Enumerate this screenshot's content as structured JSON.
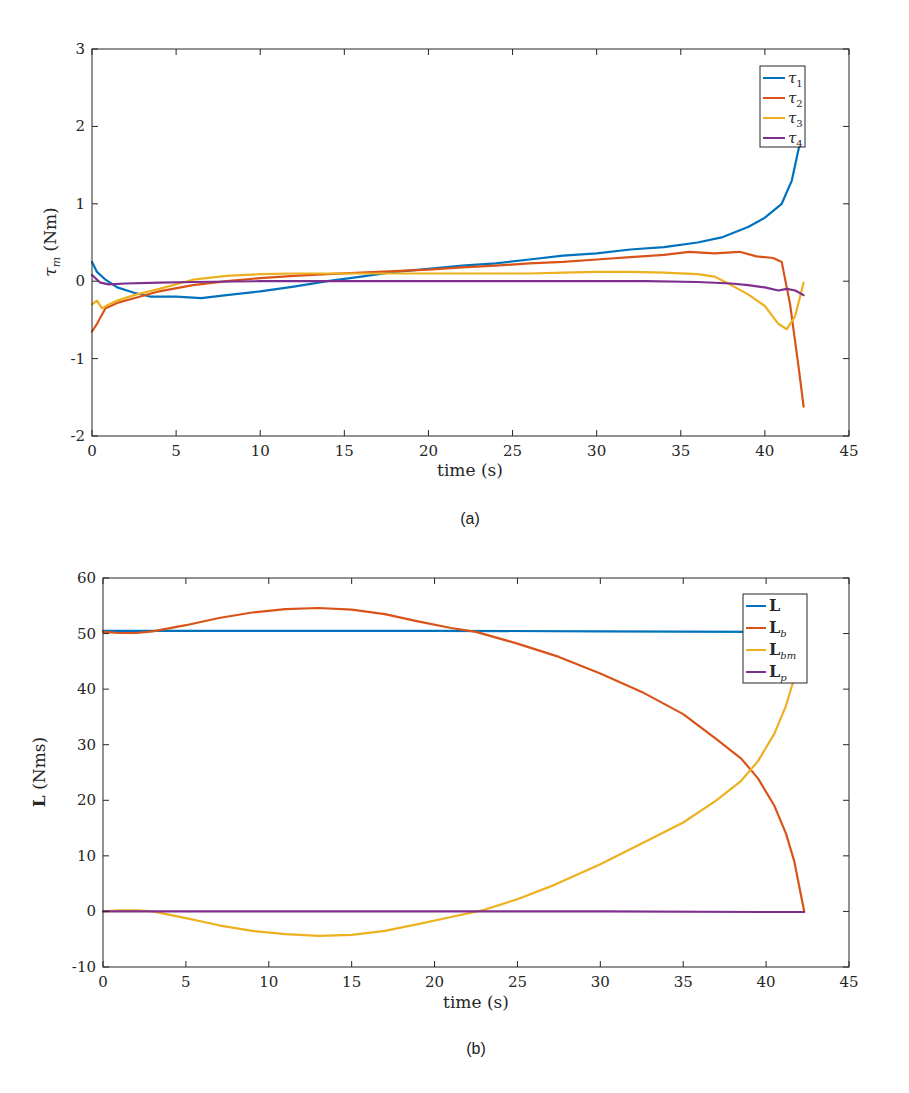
{
  "chart_data": [
    {
      "id": "a",
      "type": "line",
      "caption": "(a)",
      "title": "",
      "xlabel": "time (s)",
      "ylabel": "τm (Nm)",
      "xlim": [
        0,
        45
      ],
      "ylim": [
        -2,
        3
      ],
      "xticks": [
        0,
        5,
        10,
        15,
        20,
        25,
        30,
        35,
        40,
        45
      ],
      "yticks": [
        -2,
        -1,
        0,
        1,
        2,
        3
      ],
      "grid": false,
      "legend_position": "upper right",
      "series": [
        {
          "name": "τ1",
          "color": "#0072BD",
          "x": [
            0,
            0.3,
            0.8,
            1.5,
            2.5,
            3.5,
            5,
            6.5,
            8,
            10,
            12,
            14,
            16,
            18,
            20,
            22,
            24,
            26,
            28,
            30,
            32,
            34,
            36,
            37.5,
            39,
            40,
            41,
            41.6,
            42,
            42.3
          ],
          "y": [
            0.25,
            0.12,
            0.02,
            -0.08,
            -0.15,
            -0.2,
            -0.2,
            -0.22,
            -0.18,
            -0.13,
            -0.07,
            0.0,
            0.06,
            0.12,
            0.16,
            0.2,
            0.23,
            0.28,
            0.33,
            0.36,
            0.41,
            0.44,
            0.5,
            0.57,
            0.7,
            0.82,
            1.0,
            1.3,
            1.7,
            2.02
          ]
        },
        {
          "name": "τ2",
          "color": "#D95319",
          "x": [
            0,
            0.3,
            0.8,
            1.5,
            2.5,
            4,
            6,
            8,
            10,
            12,
            14,
            16,
            18,
            20,
            22,
            24,
            26,
            28,
            30,
            32,
            34,
            35.5,
            37,
            38.5,
            39.5,
            40.5,
            41,
            41.5,
            42,
            42.3
          ],
          "y": [
            -0.65,
            -0.55,
            -0.35,
            -0.28,
            -0.22,
            -0.13,
            -0.05,
            0.0,
            0.04,
            0.07,
            0.09,
            0.11,
            0.13,
            0.15,
            0.18,
            0.2,
            0.23,
            0.25,
            0.28,
            0.31,
            0.34,
            0.38,
            0.36,
            0.38,
            0.32,
            0.3,
            0.25,
            -0.3,
            -1.1,
            -1.62
          ]
        },
        {
          "name": "τ3",
          "color": "#EDB120",
          "x": [
            0,
            0.3,
            0.6,
            1.0,
            1.5,
            2.5,
            4,
            6,
            8,
            10,
            12,
            14,
            16,
            18,
            20,
            22,
            24,
            26,
            28,
            30,
            32,
            34,
            36,
            37,
            38,
            39,
            40,
            40.8,
            41.3,
            41.8,
            42.3
          ],
          "y": [
            -0.3,
            -0.25,
            -0.35,
            -0.3,
            -0.25,
            -0.18,
            -0.1,
            0.02,
            0.07,
            0.09,
            0.1,
            0.1,
            0.1,
            0.1,
            0.1,
            0.1,
            0.1,
            0.1,
            0.11,
            0.12,
            0.12,
            0.11,
            0.09,
            0.06,
            -0.05,
            -0.17,
            -0.32,
            -0.55,
            -0.62,
            -0.45,
            -0.02
          ]
        },
        {
          "name": "τ4",
          "color": "#7E2F8E",
          "x": [
            0,
            0.5,
            1.0,
            2,
            4,
            6,
            10,
            15,
            20,
            25,
            30,
            33,
            36,
            38,
            39,
            40,
            40.8,
            41.3,
            41.8,
            42.3
          ],
          "y": [
            0.08,
            -0.02,
            -0.04,
            -0.03,
            -0.02,
            -0.01,
            0.0,
            0.0,
            0.0,
            0.0,
            0.0,
            0.0,
            -0.01,
            -0.03,
            -0.05,
            -0.08,
            -0.12,
            -0.1,
            -0.12,
            -0.18
          ]
        }
      ]
    },
    {
      "id": "b",
      "type": "line",
      "caption": "(b)",
      "title": "",
      "xlabel": "time (s)",
      "ylabel": "L (Nms)",
      "xlim": [
        0,
        45
      ],
      "ylim": [
        -10,
        60
      ],
      "xticks": [
        0,
        5,
        10,
        15,
        20,
        25,
        30,
        35,
        40,
        45
      ],
      "yticks": [
        -10,
        0,
        10,
        20,
        30,
        40,
        50,
        60
      ],
      "grid": false,
      "legend_position": "upper right",
      "series": [
        {
          "name": "L",
          "color": "#0072BD",
          "x": [
            0,
            10,
            20,
            30,
            40,
            42.3
          ],
          "y": [
            50.5,
            50.5,
            50.5,
            50.4,
            50.3,
            50.3
          ]
        },
        {
          "name": "Lb",
          "color": "#D95319",
          "x": [
            0,
            1,
            2,
            3,
            5,
            7,
            9,
            11,
            13,
            15,
            17,
            19,
            21,
            22.5,
            25,
            27.5,
            30,
            32.5,
            35,
            37,
            38.5,
            39.5,
            40.5,
            41.2,
            41.7,
            42.1,
            42.3
          ],
          "y": [
            50.3,
            50.1,
            50.1,
            50.4,
            51.5,
            52.8,
            53.8,
            54.4,
            54.6,
            54.3,
            53.5,
            52.2,
            51.0,
            50.3,
            48.2,
            45.8,
            42.8,
            39.5,
            35.5,
            31.0,
            27.5,
            24.0,
            19.0,
            14.0,
            9.0,
            3.0,
            0.0
          ]
        },
        {
          "name": "Lbm",
          "color": "#EDB120",
          "x": [
            0,
            1,
            2,
            3,
            5,
            7,
            9,
            11,
            13,
            15,
            17,
            19,
            21,
            23,
            25,
            27,
            30,
            33,
            35,
            37,
            38.5,
            39.5,
            40.5,
            41.2,
            41.7,
            42.1,
            42.3
          ],
          "y": [
            0.0,
            0.2,
            0.2,
            0.0,
            -1.2,
            -2.5,
            -3.5,
            -4.1,
            -4.4,
            -4.2,
            -3.5,
            -2.3,
            -1.0,
            0.3,
            2.2,
            4.5,
            8.5,
            13.0,
            16.0,
            20.0,
            23.5,
            27.0,
            32.0,
            37.0,
            42.0,
            47.0,
            50.3
          ]
        },
        {
          "name": "Lp",
          "color": "#7E2F8E",
          "x": [
            0,
            10,
            20,
            30,
            40,
            42.3
          ],
          "y": [
            0.0,
            0.0,
            0.0,
            0.0,
            -0.1,
            -0.1
          ]
        }
      ]
    }
  ],
  "figure_a": {
    "caption": "(a)",
    "xlabel": "time (s)",
    "ylabel_symbol": "τ",
    "ylabel_sub": "m",
    "ylabel_unit": " (Nm)",
    "legend": [
      {
        "sym": "τ",
        "sub": "1"
      },
      {
        "sym": "τ",
        "sub": "2"
      },
      {
        "sym": "τ",
        "sub": "3"
      },
      {
        "sym": "τ",
        "sub": "4"
      }
    ]
  },
  "figure_b": {
    "caption": "(b)",
    "xlabel": "time (s)",
    "ylabel_symbol": "L",
    "ylabel_unit": " (Nms)",
    "legend": [
      {
        "sym": "L",
        "sub": ""
      },
      {
        "sym": "L",
        "sub": "b"
      },
      {
        "sym": "L",
        "sub": "bm"
      },
      {
        "sym": "L",
        "sub": "p"
      }
    ]
  }
}
